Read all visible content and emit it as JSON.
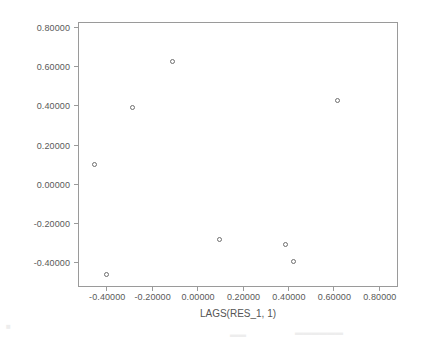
{
  "chart_data": {
    "type": "scatter",
    "title": "",
    "xlabel": "LAGS(RES_1, 1)",
    "ylabel": "Unstandardized Residual",
    "xlim": [
      -0.52,
      0.88
    ],
    "ylim": [
      -0.52,
      0.82
    ],
    "grid": false,
    "legend": null,
    "x_ticks": [
      -0.4,
      -0.2,
      0.0,
      0.2,
      0.4,
      0.6,
      0.8
    ],
    "y_ticks": [
      -0.4,
      -0.2,
      0.0,
      0.2,
      0.4,
      0.6,
      0.8
    ],
    "x_tick_labels": [
      "-0.40000",
      "-0.20000",
      "0.00000",
      "0.20000",
      "0.40000",
      "0.60000",
      "0.80000"
    ],
    "y_tick_labels": [
      "-0.40000",
      "-0.20000",
      "0.00000",
      "0.20000",
      "0.40000",
      "0.60000",
      "0.80000"
    ],
    "marker": "open-circle",
    "marker_color": "#6e6e6e",
    "points": [
      {
        "x": -0.45,
        "y": 0.1
      },
      {
        "x": -0.4,
        "y": -0.46
      },
      {
        "x": -0.285,
        "y": 0.39
      },
      {
        "x": -0.11,
        "y": 0.625
      },
      {
        "x": 0.1,
        "y": -0.285
      },
      {
        "x": 0.39,
        "y": -0.31
      },
      {
        "x": 0.425,
        "y": -0.395
      },
      {
        "x": 0.62,
        "y": 0.425
      }
    ]
  },
  "axes": {
    "x_title": "LAGS(RES_1, 1)",
    "y_title": "Unstandardized Residual"
  }
}
